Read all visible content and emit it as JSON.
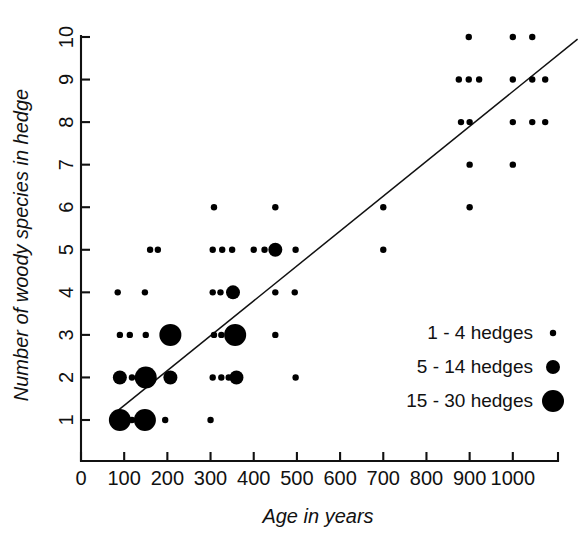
{
  "chart_data": {
    "type": "scatter",
    "title": "",
    "xlabel": "Age in years",
    "ylabel": "Number of woody species in hedge",
    "xlim": [
      0,
      1100
    ],
    "ylim": [
      0,
      10.6
    ],
    "grid": false,
    "xticks": [
      0,
      100,
      200,
      300,
      400,
      500,
      600,
      700,
      800,
      900,
      1000
    ],
    "xtick_labels": [
      "0",
      "100",
      "200",
      "300",
      "400",
      "500",
      "600",
      "700",
      "800",
      "900",
      "1000"
    ],
    "yticks": [
      1,
      2,
      3,
      4,
      5,
      6,
      7,
      8,
      9,
      10
    ],
    "ytick_labels": [
      "1",
      "2",
      "3",
      "4",
      "5",
      "6",
      "7",
      "8",
      "9",
      "10"
    ],
    "size_encoding": "marker area encodes number of hedges",
    "marker_sizes": {
      "small": 3.2,
      "medium": 7.0,
      "large": 11.0
    },
    "legend": {
      "position": "inside-right",
      "entries": [
        {
          "label": "1 - 4 hedges",
          "size": "small"
        },
        {
          "label": "5 - 14 hedges",
          "size": "medium"
        },
        {
          "label": "15 - 30 hedges",
          "size": "large"
        }
      ]
    },
    "trend_line": {
      "type": "linear-fit",
      "x_start": 78,
      "y_start": 1.16,
      "x_end": 1150,
      "y_end": 9.95
    },
    "points": [
      {
        "x": 90,
        "y": 1,
        "size": "large"
      },
      {
        "x": 118,
        "y": 1,
        "size": "small"
      },
      {
        "x": 148,
        "y": 1,
        "size": "large"
      },
      {
        "x": 195,
        "y": 1,
        "size": "small"
      },
      {
        "x": 300,
        "y": 1,
        "size": "small"
      },
      {
        "x": 90,
        "y": 2,
        "size": "medium"
      },
      {
        "x": 118,
        "y": 2,
        "size": "small"
      },
      {
        "x": 150,
        "y": 2,
        "size": "large"
      },
      {
        "x": 207,
        "y": 2,
        "size": "medium"
      },
      {
        "x": 305,
        "y": 2,
        "size": "small"
      },
      {
        "x": 325,
        "y": 2,
        "size": "small"
      },
      {
        "x": 342,
        "y": 2,
        "size": "small"
      },
      {
        "x": 360,
        "y": 2,
        "size": "medium"
      },
      {
        "x": 497,
        "y": 2,
        "size": "small"
      },
      {
        "x": 90,
        "y": 3,
        "size": "small"
      },
      {
        "x": 113,
        "y": 3,
        "size": "small"
      },
      {
        "x": 150,
        "y": 3,
        "size": "small"
      },
      {
        "x": 207,
        "y": 3,
        "size": "large"
      },
      {
        "x": 308,
        "y": 3,
        "size": "small"
      },
      {
        "x": 325,
        "y": 3,
        "size": "small"
      },
      {
        "x": 357,
        "y": 3,
        "size": "large"
      },
      {
        "x": 450,
        "y": 3,
        "size": "small"
      },
      {
        "x": 85,
        "y": 4,
        "size": "small"
      },
      {
        "x": 148,
        "y": 4,
        "size": "small"
      },
      {
        "x": 305,
        "y": 4,
        "size": "small"
      },
      {
        "x": 323,
        "y": 4,
        "size": "small"
      },
      {
        "x": 352,
        "y": 4,
        "size": "medium"
      },
      {
        "x": 450,
        "y": 4,
        "size": "small"
      },
      {
        "x": 495,
        "y": 4,
        "size": "small"
      },
      {
        "x": 160,
        "y": 5,
        "size": "small"
      },
      {
        "x": 178,
        "y": 5,
        "size": "small"
      },
      {
        "x": 305,
        "y": 5,
        "size": "small"
      },
      {
        "x": 327,
        "y": 5,
        "size": "small"
      },
      {
        "x": 350,
        "y": 5,
        "size": "small"
      },
      {
        "x": 400,
        "y": 5,
        "size": "small"
      },
      {
        "x": 425,
        "y": 5,
        "size": "small"
      },
      {
        "x": 450,
        "y": 5,
        "size": "medium"
      },
      {
        "x": 497,
        "y": 5,
        "size": "small"
      },
      {
        "x": 700,
        "y": 5,
        "size": "small"
      },
      {
        "x": 308,
        "y": 6,
        "size": "small"
      },
      {
        "x": 450,
        "y": 6,
        "size": "small"
      },
      {
        "x": 700,
        "y": 6,
        "size": "small"
      },
      {
        "x": 900,
        "y": 6,
        "size": "small"
      },
      {
        "x": 900,
        "y": 7,
        "size": "small"
      },
      {
        "x": 1000,
        "y": 7,
        "size": "small"
      },
      {
        "x": 880,
        "y": 8,
        "size": "small"
      },
      {
        "x": 900,
        "y": 8,
        "size": "small"
      },
      {
        "x": 1000,
        "y": 8,
        "size": "small"
      },
      {
        "x": 1045,
        "y": 8,
        "size": "small"
      },
      {
        "x": 1075,
        "y": 8,
        "size": "small"
      },
      {
        "x": 875,
        "y": 9,
        "size": "small"
      },
      {
        "x": 898,
        "y": 9,
        "size": "small"
      },
      {
        "x": 922,
        "y": 9,
        "size": "small"
      },
      {
        "x": 1000,
        "y": 9,
        "size": "small"
      },
      {
        "x": 1045,
        "y": 9,
        "size": "small"
      },
      {
        "x": 1075,
        "y": 9,
        "size": "small"
      },
      {
        "x": 898,
        "y": 10,
        "size": "small"
      },
      {
        "x": 1000,
        "y": 10,
        "size": "small"
      },
      {
        "x": 1045,
        "y": 10,
        "size": "small"
      }
    ]
  }
}
